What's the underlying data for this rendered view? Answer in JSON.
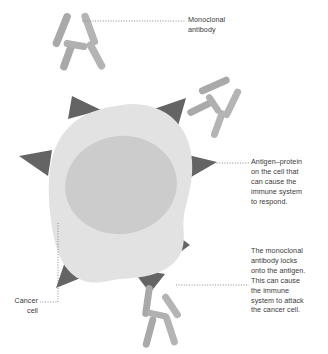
{
  "diagram": {
    "background_color": "#ffffff",
    "width": 328,
    "height": 354
  },
  "colors": {
    "cell_cytoplasm": "#e2e2e2",
    "cell_nucleus": "#cccccc",
    "antigen_spike": "#646464",
    "antibody": "#a9a9a9",
    "antibody_light": "#b6b6b6",
    "leader_line": "#8a8a8a",
    "text": "#3a3a3a"
  },
  "labels": {
    "monoclonal_antibody": {
      "lines": [
        "Monoclonal",
        "antibody"
      ],
      "text": "Monoclonal\nantibody"
    },
    "antigen": {
      "lines": [
        "Antigen–protein",
        "on the cell that",
        "can cause the",
        "immune system",
        "to respond."
      ],
      "text": "Antigen–protein\non the cell that\ncan cause the\nimmune system\nto respond."
    },
    "antibody_locks": {
      "lines": [
        "The monoclonal",
        "antibody locks",
        "onto the antigen.",
        "This can cause",
        "the immune",
        "system to attack",
        "the cancer cell."
      ],
      "text": "The monoclonal\nantibody locks\nonto the antigen.\nThis can cause\nthe immune\nsystem to attack\nthe cancer cell."
    },
    "cancer_cell": {
      "lines": [
        "Cancer",
        "cell"
      ],
      "text": "Cancer\ncell"
    }
  },
  "elements": {
    "cancer_cell_body": "irregular-blob-cell",
    "cell_nucleus": "nucleus-oval",
    "antigen_spikes_count": 7,
    "antibodies_count": 3,
    "bound_antibodies_count": 1,
    "free_antibodies_count": 2
  }
}
